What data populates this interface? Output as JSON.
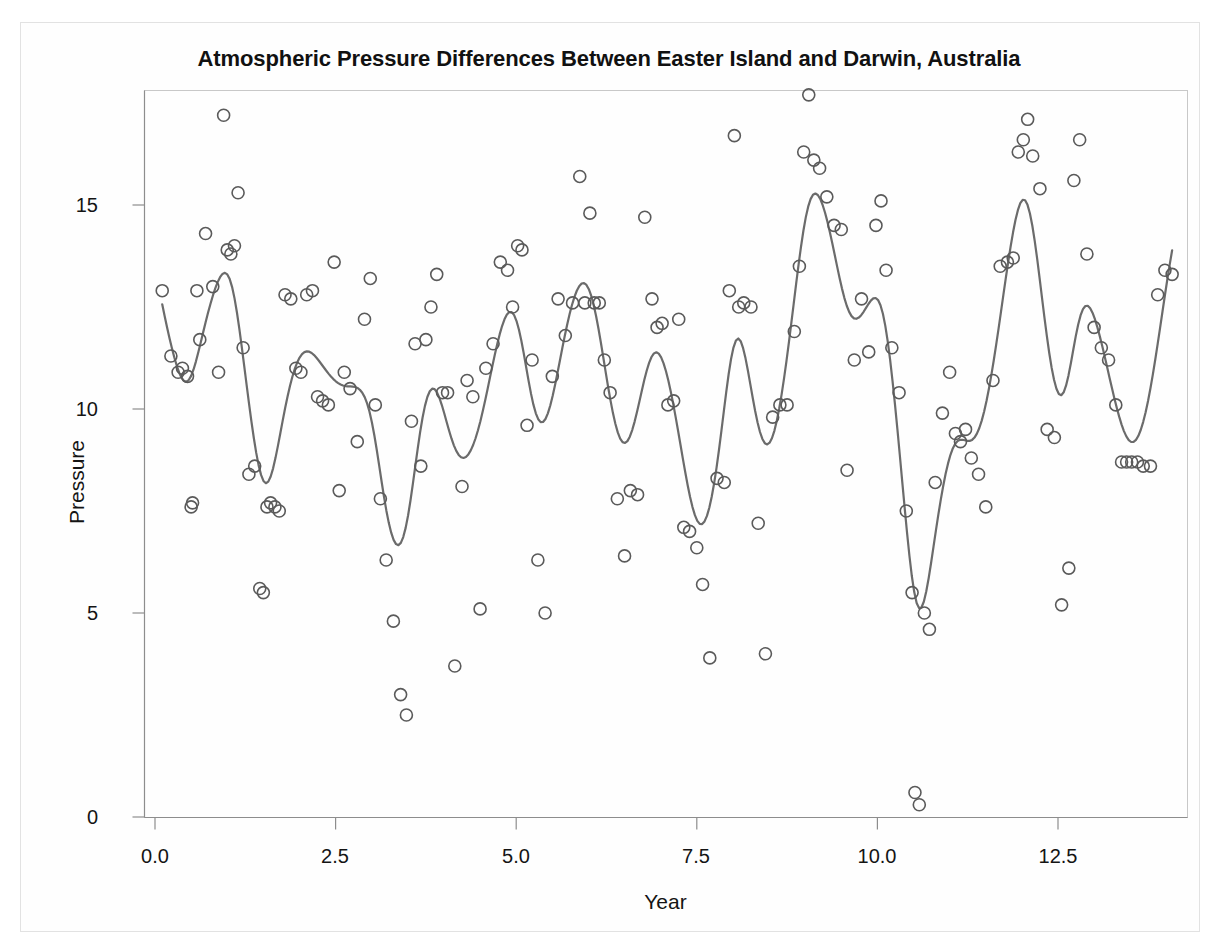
{
  "figure": {
    "title": "Atmospheric Pressure Differences Between Easter Island and Darwin, Australia",
    "background_color": "#ffffff",
    "frame_color": "#e2e2e2"
  },
  "chart_data": {
    "type": "scatter",
    "title": "Atmospheric Pressure Differences Between Easter Island and Darwin, Australia",
    "xlabel": "Year",
    "ylabel": "Pressure",
    "xlim": [
      -0.2,
      14.4
    ],
    "ylim": [
      -0.4,
      18.1
    ],
    "xticks": [
      0.0,
      2.5,
      5.0,
      7.5,
      10.0,
      12.5
    ],
    "xtick_labels": [
      "0.0",
      "2.5",
      "5.0",
      "7.5",
      "10.0",
      "12.5"
    ],
    "yticks": [
      0,
      5,
      10,
      15
    ],
    "ytick_labels": [
      "0",
      "5",
      "10",
      "15"
    ],
    "grid": false,
    "legend": null,
    "marker": {
      "style": "open-circle",
      "radius_px": 6,
      "stroke": "#5a5a5a",
      "stroke_width": 1.6,
      "fill": "none"
    },
    "fit_line": {
      "name": "smoothing spline fit",
      "stroke": "#6b6b6b",
      "stroke_width": 2.2
    },
    "series": [
      {
        "name": "Pressure observations",
        "x": [
          0.1,
          0.22,
          0.32,
          0.38,
          0.45,
          0.5,
          0.52,
          0.58,
          0.62,
          0.7,
          0.8,
          0.88,
          0.95,
          1.0,
          1.05,
          1.1,
          1.15,
          1.22,
          1.3,
          1.38,
          1.45,
          1.5,
          1.55,
          1.6,
          1.66,
          1.72,
          1.8,
          1.88,
          1.95,
          2.02,
          2.1,
          2.18,
          2.25,
          2.32,
          2.4,
          2.48,
          2.55,
          2.62,
          2.7,
          2.8,
          2.9,
          2.98,
          3.05,
          3.12,
          3.2,
          3.3,
          3.4,
          3.48,
          3.55,
          3.6,
          3.68,
          3.75,
          3.82,
          3.9,
          3.98,
          4.05,
          4.15,
          4.25,
          4.32,
          4.4,
          4.5,
          4.58,
          4.68,
          4.78,
          4.88,
          4.95,
          5.02,
          5.08,
          5.15,
          5.22,
          5.3,
          5.4,
          5.5,
          5.58,
          5.68,
          5.78,
          5.88,
          5.95,
          6.02,
          6.08,
          6.15,
          6.22,
          6.3,
          6.4,
          6.5,
          6.58,
          6.68,
          6.78,
          6.88,
          6.95,
          7.02,
          7.1,
          7.18,
          7.25,
          7.32,
          7.4,
          7.5,
          7.58,
          7.68,
          7.78,
          7.88,
          7.95,
          8.02,
          8.08,
          8.15,
          8.25,
          8.35,
          8.45,
          8.55,
          8.65,
          8.75,
          8.85,
          8.92,
          8.98,
          9.05,
          9.12,
          9.2,
          9.3,
          9.4,
          9.5,
          9.58,
          9.68,
          9.78,
          9.88,
          9.98,
          10.05,
          10.12,
          10.2,
          10.3,
          10.4,
          10.48,
          10.52,
          10.58,
          10.65,
          10.72,
          10.8,
          10.9,
          11.0,
          11.08,
          11.15,
          11.22,
          11.3,
          11.4,
          11.5,
          11.6,
          11.7,
          11.8,
          11.88,
          11.95,
          12.02,
          12.08,
          12.15,
          12.25,
          12.35,
          12.45,
          12.55,
          12.65,
          12.72,
          12.8,
          12.9,
          13.0,
          13.1,
          13.2,
          13.3,
          13.38,
          13.45,
          13.52,
          13.6,
          13.68,
          13.78,
          13.88,
          13.98,
          14.08
        ],
        "y": [
          12.9,
          11.3,
          10.9,
          11.0,
          10.8,
          7.6,
          7.7,
          12.9,
          11.7,
          14.3,
          13.0,
          10.9,
          17.2,
          13.9,
          13.8,
          14.0,
          15.3,
          11.5,
          8.4,
          8.6,
          5.6,
          5.5,
          7.6,
          7.7,
          7.6,
          7.5,
          12.8,
          12.7,
          11.0,
          10.9,
          12.8,
          12.9,
          10.3,
          10.2,
          10.1,
          13.6,
          8.0,
          10.9,
          10.5,
          9.2,
          12.2,
          13.2,
          10.1,
          7.8,
          6.3,
          4.8,
          3.0,
          2.5,
          9.7,
          11.6,
          8.6,
          11.7,
          12.5,
          13.3,
          10.4,
          10.4,
          3.7,
          8.1,
          10.7,
          10.3,
          5.1,
          11.0,
          11.6,
          13.6,
          13.4,
          12.5,
          14.0,
          13.9,
          9.6,
          11.2,
          6.3,
          5.0,
          10.8,
          12.7,
          11.8,
          12.6,
          15.7,
          12.6,
          14.8,
          12.6,
          12.6,
          11.2,
          10.4,
          7.8,
          6.4,
          8.0,
          7.9,
          14.7,
          12.7,
          12.0,
          12.1,
          10.1,
          10.2,
          12.2,
          7.1,
          7.0,
          6.6,
          5.7,
          3.9,
          8.3,
          8.2,
          12.9,
          16.7,
          12.5,
          12.6,
          12.5,
          7.2,
          4.0,
          9.8,
          10.1,
          10.1,
          11.9,
          13.5,
          16.3,
          17.7,
          16.1,
          15.9,
          15.2,
          14.5,
          14.4,
          8.5,
          11.2,
          12.7,
          11.4,
          14.5,
          15.1,
          13.4,
          11.5,
          10.4,
          7.5,
          5.5,
          0.6,
          0.3,
          5.0,
          4.6,
          8.2,
          9.9,
          10.9,
          9.4,
          9.2,
          9.5,
          8.8,
          8.4,
          7.6,
          10.7,
          13.5,
          13.6,
          13.7,
          16.3,
          16.6,
          17.1,
          16.2,
          15.4,
          9.5,
          9.3,
          5.2,
          6.1,
          15.6,
          16.6,
          13.8,
          12.0,
          11.5,
          11.2,
          10.1,
          8.7,
          8.7,
          8.7,
          8.7,
          8.6,
          8.6,
          12.8,
          13.4,
          13.3
        ],
        "n_points": 163
      }
    ]
  },
  "axes": {
    "y_label": "Pressure",
    "x_label": "Year",
    "y_tick_labels": [
      "15",
      "10",
      "5",
      "0"
    ],
    "x_tick_labels": [
      "0.0",
      "2.5",
      "5.0",
      "7.5",
      "10.0",
      "12.5"
    ]
  }
}
